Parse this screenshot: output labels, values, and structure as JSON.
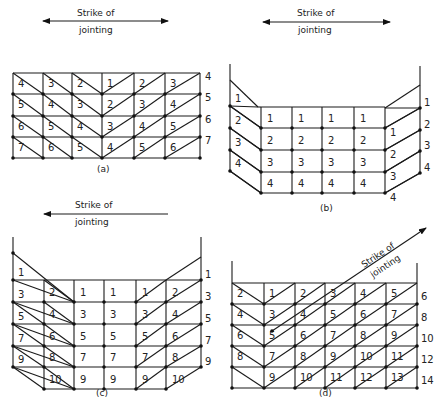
{
  "figures": [
    {
      "id": "a",
      "caption": "(a)",
      "strike_label_line1": "Strike of",
      "strike_label_line2": "jointing",
      "arrow": {
        "type": "double",
        "x1": 43,
        "y1": 21,
        "x2": 168,
        "y2": 21
      },
      "label_pos": {
        "x1": 77,
        "y1": 16,
        "x2": 79,
        "y2": 32
      },
      "caption_pos": {
        "x": 98,
        "y": 173
      },
      "cols": [
        13,
        43,
        72,
        102,
        134,
        165,
        200
      ],
      "rows": [
        73,
        94,
        116,
        137,
        158
      ],
      "cells": [
        [
          4,
          3,
          2,
          1,
          2,
          3
        ],
        [
          5,
          4,
          3,
          2,
          3,
          4
        ],
        [
          6,
          5,
          4,
          3,
          4,
          5
        ],
        [
          7,
          6,
          5,
          4,
          5,
          6
        ]
      ],
      "right_labels": [
        4,
        5,
        6,
        7
      ],
      "diag": [
        "\\",
        "\\",
        "\\",
        "/",
        "/",
        "/"
      ]
    },
    {
      "id": "b",
      "caption": "(b)",
      "strike_label_line1": "Strike of",
      "strike_label_line2": "jointing",
      "arrow": {
        "type": "double",
        "x1": 263,
        "y1": 22,
        "x2": 390,
        "y2": 22
      },
      "label_pos": {
        "x1": 297,
        "y1": 16,
        "x2": 298,
        "y2": 32
      },
      "caption_pos": {
        "x": 323,
        "y": 212
      },
      "left_col": [
        {
          "label": "1",
          "top": 107
        },
        {
          "label": "2",
          "top": 128
        },
        {
          "label": "3",
          "top": 150
        },
        {
          "label": "4",
          "top": 171
        }
      ],
      "cells_mid": [
        [
          "1",
          "1",
          "1",
          "1"
        ],
        [
          "2",
          "2",
          "2",
          "2"
        ],
        [
          "3",
          "3",
          "3",
          "3"
        ],
        [
          "4",
          "4",
          "4",
          "4"
        ]
      ],
      "right_cells": [
        "1",
        "2",
        "3",
        "4"
      ],
      "right_labels": [
        "1",
        "2",
        "3",
        "4"
      ]
    },
    {
      "id": "c",
      "caption": "(c)",
      "strike_label_line1": "Strike of",
      "strike_label_line2": "jointing",
      "arrow": {
        "type": "left",
        "x1": 168,
        "y1": 215,
        "x2": 44,
        "y2": 215
      },
      "label_pos": {
        "x1": 75,
        "y1": 208,
        "x2": 75,
        "y2": 225
      },
      "caption_pos": {
        "x": 96,
        "y": 396
      },
      "left_labels": [
        "1",
        "3",
        "5",
        "7",
        "9"
      ],
      "col2": [
        "2",
        "4",
        "6",
        "8",
        "10"
      ],
      "mid_cols": [
        [
          "1",
          "3",
          "5",
          "7",
          "9"
        ],
        [
          "1",
          "3",
          "5",
          "7",
          "9"
        ],
        [
          "1",
          "3",
          "5",
          "7",
          "9"
        ]
      ],
      "col_right_inner": [
        "2",
        "4",
        "6",
        "8",
        "10"
      ],
      "right_labels": [
        "1",
        "3",
        "5",
        "7",
        "9"
      ]
    },
    {
      "id": "d",
      "caption": "(d)",
      "strike_label_line1": "Strike of",
      "strike_label_line2": "jointing",
      "arrow": {
        "type": "diagonal",
        "x1": 272,
        "y1": 331,
        "x2": 426,
        "y2": 228
      },
      "caption_pos": {
        "x": 320,
        "y": 396
      },
      "cols": [
        232,
        264,
        295,
        325,
        355,
        386,
        417
      ],
      "rows": [
        283,
        304,
        325,
        346,
        367,
        388
      ],
      "cells": [
        [
          "2",
          "1",
          "2",
          "3",
          "4",
          "5"
        ],
        [
          "4",
          "3",
          "4",
          "5",
          "6",
          "7"
        ],
        [
          "6",
          "5",
          "6",
          "7",
          "8",
          "9"
        ],
        [
          "8",
          "7",
          "8",
          "9",
          "10",
          "11"
        ],
        [
          "",
          "9",
          "10",
          "11",
          "12",
          "13"
        ]
      ],
      "right_labels": [
        "6",
        "8",
        "10",
        "12",
        "14"
      ]
    }
  ]
}
